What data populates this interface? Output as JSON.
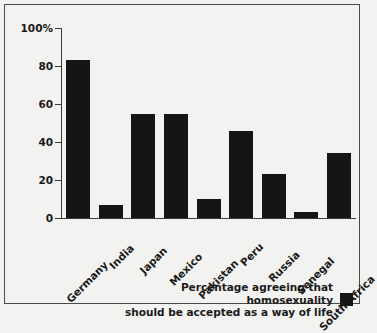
{
  "chart_data": {
    "type": "bar",
    "title": "",
    "xlabel": "",
    "ylabel": "",
    "ylim": [
      0,
      100
    ],
    "yticks": [
      0,
      20,
      40,
      60,
      80,
      100
    ],
    "ytick_labels": [
      "0",
      "20",
      "40",
      "60",
      "80",
      "100%"
    ],
    "grid": false,
    "legend_position": "bottom-right",
    "bar_color": "#151515",
    "categories": [
      "Germany",
      "India",
      "Japan",
      "Mexico",
      "Pakistan",
      "Peru",
      "Russia",
      "Senegal",
      "South Africa"
    ],
    "values": [
      83,
      7,
      55,
      55,
      10,
      46,
      23,
      3,
      34
    ],
    "series": [
      {
        "name": "Percentage agreeing that homosexuality should be accepted as a way of life",
        "values": [
          83,
          7,
          55,
          55,
          10,
          46,
          23,
          3,
          34
        ]
      }
    ],
    "legend": [
      {
        "line1": "Percentage agreeing that homosexuality",
        "line2": "should be accepted as a way of life",
        "swatch_color": "#151515"
      }
    ]
  },
  "frame": {
    "border_color": "#4a4a4a",
    "background": "#f2f2f0"
  }
}
